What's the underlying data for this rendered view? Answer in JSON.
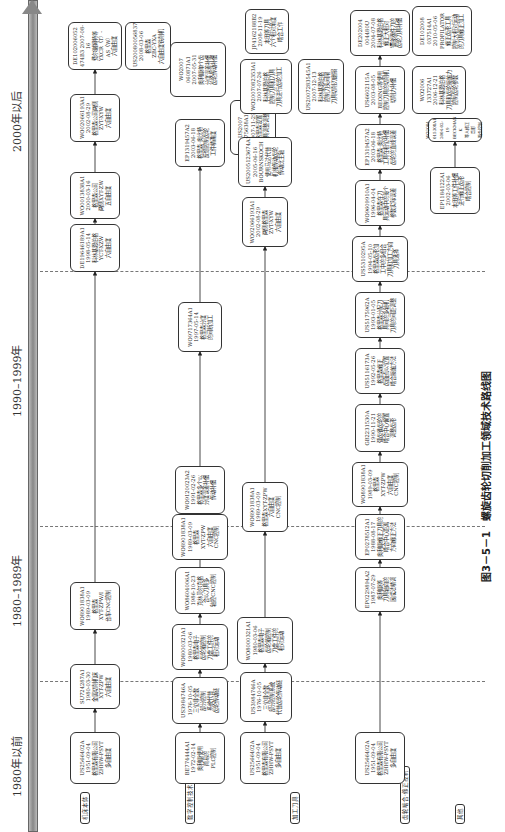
{
  "figure": {
    "caption": "图3－5－1　螺旋齿轮切削加工领域技术路线图"
  },
  "timeline": {
    "periods": [
      "1980年以前",
      "1980–1989年",
      "1990–1999年",
      "2000年以后"
    ]
  },
  "rows": [
    {
      "label": "机床本体",
      "nodes": [
        {
          "id": "r1n1",
          "lines": [
            "US2566402A",
            "1951-09-04",
            "格里森有限公司",
            "ZHHW-PSYT",
            "多自由度"
          ]
        },
        {
          "id": "r1n2",
          "lines": [
            "SU724287A1",
            "1980-03-30",
            "金属切削机床",
            "XYT-ZPW",
            "六自由度"
          ]
        },
        {
          "id": "r1n3",
          "lines": [
            "WO8901838A1",
            "1989-03-09",
            "格里森",
            "XYT-ZPW/I",
            "台车CNC控制"
          ]
        },
        {
          "id": "r1n4",
          "lines": [
            "DE19646189A1",
            "1998-05-14",
            "科林基恩伯格",
            "YCT-XZW",
            "六自由度"
          ]
        },
        {
          "id": "r1n5",
          "lines": [
            "WO0013838A1",
            "2000-03-16",
            "格里森公司",
            "两侧XYT-ZW",
            "五自由度"
          ]
        },
        {
          "id": "r1n6",
          "lines": [
            "WO02066193A1",
            "2002-08-29",
            "格里森公司两侧",
            "ZYT-XYW",
            "六自由度"
          ]
        },
        {
          "id": "r1n7",
          "lines": [
            "DE102006052",
            "474B3 2007-08-16",
            "费尔谢姆特等",
            "YXCR（T）-",
            "AS（W）",
            "六自由度"
          ]
        },
        {
          "id": "r1n8",
          "lines": [
            "US20080056837",
            "2008-03-06",
            "格里森",
            "ZBC-YXA",
            "六自由度铣削机"
          ]
        }
      ]
    },
    {
      "label": "数字控制技术",
      "nodes": [
        {
          "id": "r2n1",
          "lines": [
            "BE774444A1",
            "1972-02-14",
            "奥利康使用",
            "简易的",
            "PLC控制"
          ]
        },
        {
          "id": "r2n2",
          "lines": [
            "US3984746A",
            "1976-10-05",
            "三位非全数",
            "部分控制",
            "系统代替",
            "齿轮传动链"
          ]
        },
        {
          "id": "r2n3",
          "lines": [
            "WO8000321A1",
            "1980-03-06",
            "格里森电子",
            "齿轮箱控制",
            "刀盘工件的",
            "相对运动"
          ]
        },
        {
          "id": "r2n4",
          "lines": [
            "WO8604006A1",
            "1986-10-23",
            "克林贝尔克格",
            "合以刀具多",
            "轴控CNC控制"
          ]
        },
        {
          "id": "r2n5",
          "lines": [
            "WO8901838A1",
            "1989-03-09",
            "格里森",
            "XYT-ZPW",
            "六自由度",
            "CNC控制"
          ]
        },
        {
          "id": "r2n6",
          "lines": [
            "WO9120023A2",
            "1991-02-26",
            "格里森多个以",
            "分度误差补偿",
            "传动补偿"
          ]
        },
        {
          "id": "r2n7",
          "lines": [
            "WO9717364A1",
            "1997-05-14",
            "格里森分度",
            "的间断加工"
          ]
        },
        {
          "id": "r2n8",
          "lines": [
            "EP1319457A2",
            "2003-06-18",
            "格里森·奥比特",
            "反馈控制齿轮",
            "工件精确度"
          ]
        },
        {
          "id": "r2n9",
          "lines": [
            "WO2007",
            "060871A1",
            "2007-05-31",
            "奥利康单个齿",
            "分度误差补偿",
            "齿轮传动补偿"
          ]
        },
        {
          "id": "r2n10",
          "lines": [
            "US2007",
            "275638A1",
            "2007-11-29",
            "格里森设置",
            "刀具调整调整",
            "刀具和齿轮位置"
          ]
        }
      ]
    },
    {
      "label": "加工刀具",
      "nodes": [
        {
          "id": "r3n1",
          "lines": [
            "US2566402A",
            "1951-09-04",
            "格里森有限公司",
            "ZHHW-PSYT",
            "多自由度"
          ]
        },
        {
          "id": "r3n2",
          "lines": [
            "US3984746A",
            "1976-10-05",
            "三位非全数",
            "部分控制系统",
            "代替齿轮传动链"
          ]
        },
        {
          "id": "r3n3",
          "lines": [
            "WO8000321A1",
            "1980-03-06",
            "格里森电子",
            "齿轮箱控制",
            "刀盘工件的",
            "相对运动"
          ]
        },
        {
          "id": "r3n4",
          "lines": [
            "WO8901838A1",
            "1989-03-09",
            "格里森XYT-ZPW",
            "六自由度",
            "CNC控制"
          ]
        },
        {
          "id": "r3n5",
          "lines": [
            "WO02066193A1",
            "2002-08-29",
            "两侧格里森",
            "ZYT-XYW",
            "六自由度"
          ]
        },
        {
          "id": "r3n6",
          "lines": [
            "US2005123674A1",
            "2005-06-16",
            "BOURNSKOCH",
            "使用马达代替",
            "机械传动齿轮",
            "传动比主轴"
          ]
        },
        {
          "id": "r3n7",
          "lines": [
            "WO2007082353A1",
            "2007-07-26",
            "科林基恩伯格",
            "控制刀具和刀具",
            "刀具进行齿轮加工"
          ]
        },
        {
          "id": "r3n8",
          "lines": [
            "US2007283545A1",
            "2007-12-13",
            "科林基恩伯格",
            "控制刀头间隔",
            "刀具切削刃磨损"
          ]
        },
        {
          "id": "r3n9",
          "lines": [
            "JP4162188B2",
            "2008-11-19",
            "本田等刀具",
            "六个相对角度",
            "啮合工作"
          ]
        }
      ]
    },
    {
      "label": "齿轮啮合·修正控制",
      "nodes": [
        {
          "id": "r4n1",
          "lines": [
            "US2566402A",
            "1951-09-04",
            "格里森有限公司",
            "ZHHW-PSYT",
            "多自由度"
          ]
        },
        {
          "id": "r4n2",
          "lines": [
            "EP0229894A2",
            "1987-07-29",
            "奥利康等",
            "刀具轴向的",
            "展成法精调"
          ]
        },
        {
          "id": "r4n3",
          "lines": [
            "EP0278512A1",
            "1988-08-17",
            "奥利康修正刀具的",
            "啮合中心距离",
            "方向修正方法"
          ]
        },
        {
          "id": "r4n4",
          "lines": [
            "WO8901838A1",
            "1989-03-09",
            "格里森",
            "XYT-ZPW",
            "六自由度",
            "CNC控制"
          ]
        },
        {
          "id": "r4n5",
          "lines": [
            "GB2231530A",
            "1990-11-21",
            "弧齿锥齿轮的",
            "啮合中心偏置",
            "调整齿形"
          ]
        },
        {
          "id": "r4n6",
          "lines": [
            "US5116173A",
            "1992-05-26",
            "格里森修正",
            "齿面点以位置",
            "啮合接触方法"
          ]
        },
        {
          "id": "r4n7",
          "lines": [
            "US5175962A",
            "1993-01-05",
            "格里森分配刀",
            "具间的多轴机",
            "刀具的间距调整"
          ]
        },
        {
          "id": "r4n8",
          "lines": [
            "US5310295A",
            "1994-05-10",
            "格里森齿形加",
            "工中的多组合",
            "刀具和加工方向",
            "刀具选择"
          ]
        },
        {
          "id": "r4n9",
          "lines": [
            "WO9609910A1",
            "1996-04-04",
            "格里森在刀",
            "具运动中的每个",
            "参数实际误差"
          ]
        },
        {
          "id": "r4n10",
          "lines": [
            "EP1319457A2",
            "2003-06-18",
            "格里森·奥比特",
            "工具在相位补偿",
            "齿轮的直线误差"
          ]
        },
        {
          "id": "r4n11",
          "lines": [
            "US6602115A",
            "2003-08-05",
            "BEOING等使用",
            "控制刀具的切削机",
            "切削力补偿"
          ]
        },
        {
          "id": "r4n12",
          "lines": [
            "DE202004",
            "004480U",
            "2004-07-08",
            "科林基恩伯格",
            "修正大相对",
            "镶嵌器件刀的",
            "齿轮刀具补偿"
          ]
        },
        {
          "id": "r4n13",
          "lines": [
            "WO2006",
            "133727A1",
            "2006-12-21",
            "科林基恩伯格",
            "刀具和齿轮接触力",
            "控制齿轮参数"
          ]
        },
        {
          "id": "r4n14",
          "lines": [
            "DE102008",
            "037514A1",
            "2010-05-06",
            "PROFILATOR",
            "修正齿形工具",
            "控制大相对运动",
            "的刀具修正加工"
          ]
        },
        {
          "id": "r4n15",
          "lines": [
            "EP1184122A1",
            "2002-03-06",
            "本田等工件补偿",
            "进行修正齿形",
            "啮合控制"
          ]
        },
        {
          "id": "r4n16",
          "lines": [
            "WO2004",
            "015308A1",
            "2004-02-19",
            "BECKMAN K",
            "等人修正齿形",
            "啮合控制"
          ]
        }
      ]
    }
  ],
  "legend": {
    "label": "其他"
  }
}
